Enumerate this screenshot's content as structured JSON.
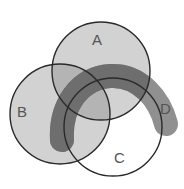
{
  "diagram": {
    "type": "venn",
    "sets": [
      {
        "id": "A",
        "label": "A",
        "shape": "circle",
        "cx": 101,
        "cy": 71,
        "r": 49,
        "fill": "#d2d2d2",
        "label_x": 98,
        "label_y": 45
      },
      {
        "id": "B",
        "label": "B",
        "shape": "circle",
        "cx": 60,
        "cy": 114,
        "r": 50,
        "fill": "#d2d2d2",
        "label_x": 22,
        "label_y": 117
      },
      {
        "id": "C",
        "label": "C",
        "shape": "circle",
        "cx": 113,
        "cy": 127,
        "r": 49,
        "fill": "#ffffff",
        "label_x": 120,
        "label_y": 163
      },
      {
        "id": "D",
        "label": "D",
        "shape": "band",
        "fill": "#7e7e7e",
        "label_x": 164,
        "label_y": 114
      }
    ],
    "colors": {
      "outline": "#2a2a2a",
      "light_fill": "#d2d2d2",
      "band_fill": "#7e7e7e",
      "label": "#555555"
    }
  }
}
